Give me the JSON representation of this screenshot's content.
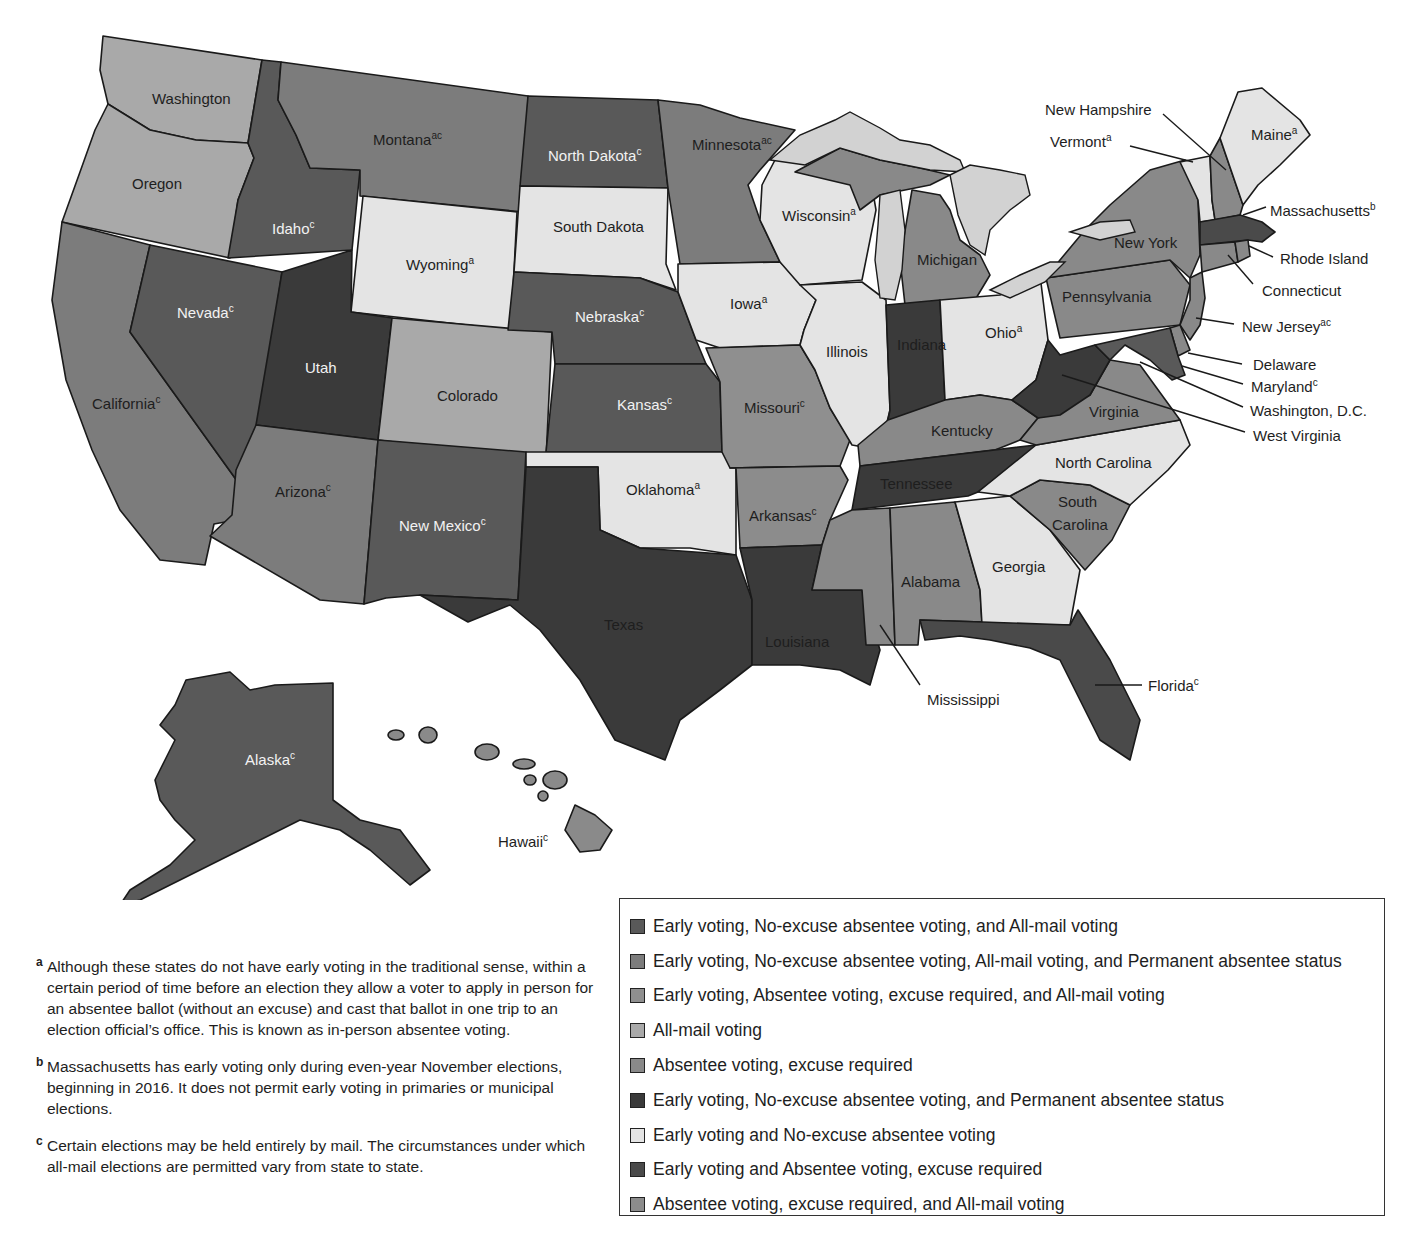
{
  "map": {
    "title_visible": false,
    "states": {
      "washington": {
        "label": "Washington",
        "sup": "",
        "category": 4
      },
      "oregon": {
        "label": "Oregon",
        "sup": "",
        "category": 4
      },
      "california": {
        "label": "California",
        "sup": "c",
        "category": 2
      },
      "idaho": {
        "label": "Idaho",
        "sup": "c",
        "category": 1
      },
      "nevada": {
        "label": "Nevada",
        "sup": "c",
        "category": 1
      },
      "montana": {
        "label": "Montana",
        "sup": "ac",
        "category": 2
      },
      "wyoming": {
        "label": "Wyoming",
        "sup": "a",
        "category": 7
      },
      "utah": {
        "label": "Utah",
        "sup": "",
        "category": 6
      },
      "arizona": {
        "label": "Arizona",
        "sup": "c",
        "category": 2
      },
      "colorado": {
        "label": "Colorado",
        "sup": "",
        "category": 4
      },
      "new_mexico": {
        "label": "New Mexico",
        "sup": "c",
        "category": 1
      },
      "north_dakota": {
        "label": "North Dakota",
        "sup": "c",
        "category": 1
      },
      "south_dakota": {
        "label": "South Dakota",
        "sup": "",
        "category": 7
      },
      "nebraska": {
        "label": "Nebraska",
        "sup": "c",
        "category": 1
      },
      "kansas": {
        "label": "Kansas",
        "sup": "c",
        "category": 1
      },
      "oklahoma": {
        "label": "Oklahoma",
        "sup": "a",
        "category": 7
      },
      "texas": {
        "label": "Texas",
        "sup": "",
        "category": 6
      },
      "minnesota": {
        "label": "Minnesota",
        "sup": "ac",
        "category": 2
      },
      "iowa": {
        "label": "Iowa",
        "sup": "a",
        "category": 7
      },
      "missouri": {
        "label": "Missouri",
        "sup": "c",
        "category": 3
      },
      "arkansas": {
        "label": "Arkansas",
        "sup": "c",
        "category": 9
      },
      "louisiana": {
        "label": "Louisiana",
        "sup": "",
        "category": 6
      },
      "wisconsin": {
        "label": "Wisconsin",
        "sup": "a",
        "category": 7
      },
      "illinois": {
        "label": "Illinois",
        "sup": "",
        "category": 7
      },
      "michigan": {
        "label": "Michigan",
        "sup": "",
        "category": 5
      },
      "indiana": {
        "label": "Indiana",
        "sup": "",
        "category": 6
      },
      "ohio": {
        "label": "Ohio",
        "sup": "a",
        "category": 7
      },
      "kentucky": {
        "label": "Kentucky",
        "sup": "",
        "category": 5
      },
      "tennessee": {
        "label": "Tennessee",
        "sup": "",
        "category": 6
      },
      "mississippi": {
        "label": "Mississippi",
        "sup": "",
        "category": 5
      },
      "alabama": {
        "label": "Alabama",
        "sup": "",
        "category": 5
      },
      "georgia": {
        "label": "Georgia",
        "sup": "",
        "category": 7
      },
      "florida": {
        "label": "Florida",
        "sup": "c",
        "category": 8
      },
      "south_carolina_1": {
        "label": "South",
        "sup": "",
        "category": 5
      },
      "south_carolina_2": {
        "label": "Carolina",
        "sup": "",
        "category": 5
      },
      "north_carolina": {
        "label": "North Carolina",
        "sup": "",
        "category": 7
      },
      "virginia": {
        "label": "Virginia",
        "sup": "",
        "category": 5
      },
      "west_virginia": {
        "label": "West Virginia",
        "sup": "",
        "category": 6
      },
      "pennsylvania": {
        "label": "Pennsylvania",
        "sup": "",
        "category": 5
      },
      "new_york": {
        "label": "New York",
        "sup": "",
        "category": 5
      },
      "vermont": {
        "label": "Vermont",
        "sup": "a",
        "category": 7
      },
      "new_hampshire": {
        "label": "New Hampshire",
        "sup": "",
        "category": 5
      },
      "maine": {
        "label": "Maine",
        "sup": "a",
        "category": 7
      },
      "massachusetts": {
        "label": "Massachusetts",
        "sup": "b",
        "category": 8
      },
      "rhode_island": {
        "label": "Rhode Island",
        "sup": "",
        "category": 5
      },
      "connecticut": {
        "label": "Connecticut",
        "sup": "",
        "category": 5
      },
      "new_jersey": {
        "label": "New Jersey",
        "sup": "ac",
        "category": 5
      },
      "delaware": {
        "label": "Delaware",
        "sup": "",
        "category": 5
      },
      "maryland": {
        "label": "Maryland",
        "sup": "c",
        "category": 1
      },
      "washington_dc": {
        "label": "Washington, D.C.",
        "sup": "",
        "category": 1
      },
      "alaska": {
        "label": "Alaska",
        "sup": "c",
        "category": 1
      },
      "hawaii": {
        "label": "Hawaii",
        "sup": "c",
        "category": 2
      }
    }
  },
  "legend": {
    "items": [
      {
        "label": "Early voting, No-excuse absentee voting, and All-mail voting",
        "color": "#595959"
      },
      {
        "label": "Early voting, No-excuse absentee voting, All-mail voting, and Permanent absentee status",
        "color": "#7c7c7c"
      },
      {
        "label": "Early voting, Absentee voting, excuse required, and All-mail voting",
        "color": "#8f8f8f"
      },
      {
        "label": "All-mail voting",
        "color": "#a9a9a9"
      },
      {
        "label": "Absentee voting, excuse required",
        "color": "#898989"
      },
      {
        "label": "Early voting, No-excuse absentee voting, and Permanent absentee status",
        "color": "#3a3a3a"
      },
      {
        "label": "Early voting and No-excuse absentee voting",
        "color": "#e4e4e4"
      },
      {
        "label": "Early voting and Absentee voting, excuse required",
        "color": "#4a4a4a"
      },
      {
        "label": "Absentee voting, excuse required,  and All-mail voting",
        "color": "#8c8c8c"
      }
    ]
  },
  "notes": [
    {
      "marker": "a",
      "text": "Although these states do not have early voting in the traditional sense, within a certain period of time before an election they allow a voter to apply in person for an absentee ballot (without an excuse) and cast that ballot in one trip to an election official’s office. This is known as in-person absentee voting."
    },
    {
      "marker": "b",
      "text": "Massachusetts has early voting only during even-year November elections, beginning in 2016. It does not permit early voting in primaries or municipal elections."
    },
    {
      "marker": "c",
      "text": "Certain elections may be held entirely by mail. The circumstances under which all-mail elections are permitted vary from state to state."
    }
  ]
}
